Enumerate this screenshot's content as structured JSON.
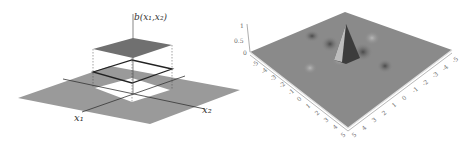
{
  "left_figure": {
    "vertical_axis_label": "b(x₁,x₂)",
    "axis_label_x1": "x₁",
    "axis_label_x2": "x₂"
  },
  "right_figure": {
    "z_ticks": [
      "1",
      "0.5",
      "0"
    ],
    "left_axis_ticks": [
      "-5",
      "-4",
      "-3",
      "-2",
      "-1",
      "0",
      "1",
      "2",
      "3",
      "4",
      "5"
    ],
    "right_axis_ticks": [
      "5",
      "4",
      "3",
      "2",
      "1",
      "0",
      "-1",
      "-2",
      "-3",
      "-4",
      "-5"
    ],
    "surface_color": "#8a8a8a"
  },
  "colors": {
    "plane": "#9a9a9a",
    "top_square": "#707070",
    "hole": "#ffffff"
  }
}
